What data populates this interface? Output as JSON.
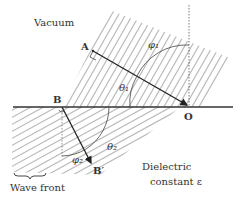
{
  "labels": {
    "vacuum": "Vacuum",
    "point_a": "A",
    "point_b": "B",
    "point_o": "O",
    "point_b_prime": "B′",
    "phi1": "φ₁",
    "theta1": "θ₁",
    "theta2": "θ₂",
    "phi2": "φ₂",
    "dielectric_line1": "Dielectric",
    "dielectric_line2": "constant ε",
    "wave_front": "Wave front"
  },
  "colors": {
    "line": "#333333",
    "hatch": "#bbbbbb",
    "text": "#333333"
  }
}
